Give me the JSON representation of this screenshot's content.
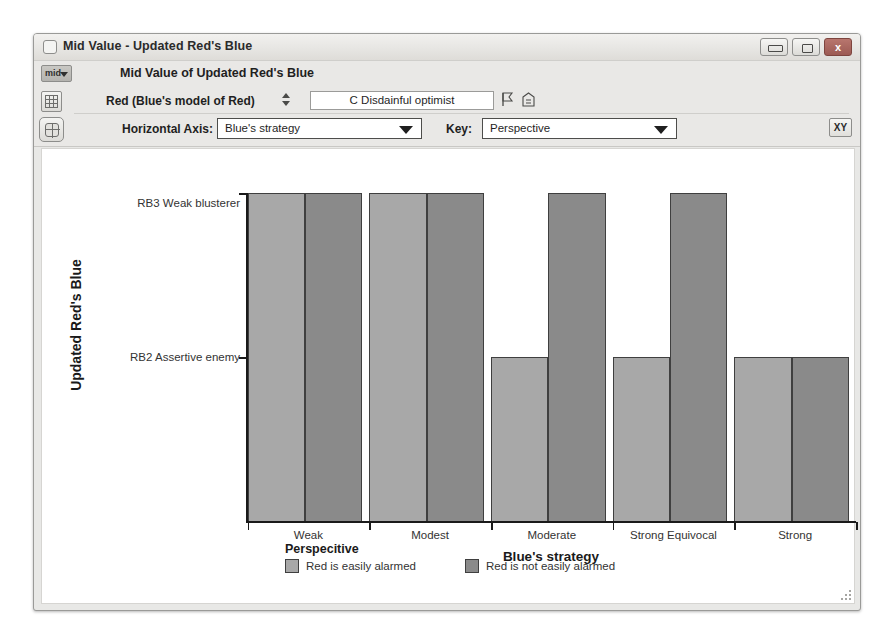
{
  "window": {
    "title": "Mid Value - Updated Red's Blue",
    "title_icon": "window-icon",
    "buttons": {
      "minimize": "minimize-icon",
      "maximize": "maximize-icon",
      "close_label": "x"
    }
  },
  "toolbar": {
    "mid_button_label": "mid",
    "chart_title": "Mid Value of Updated Red's Blue",
    "picker_label": "Red (Blue's model of Red)",
    "picker_value": "C Disdainful optimist",
    "picker_placeholder": "C Disdainful optimist",
    "updown_icon": "up-down-arrow-icon",
    "mini_icon_1": "flag-icon",
    "mini_icon_2": "building-icon",
    "grid_icon": "grid-icon",
    "table_icon": "table-icon",
    "horizontal_axis_label": "Horizontal Axis:",
    "horizontal_axis_value": "Blue's strategy",
    "horizontal_axis_options": [
      "Blue's strategy"
    ],
    "key_label": "Key:",
    "key_value": "Perspective",
    "key_options": [
      "Perspective"
    ],
    "xy_button_label": "XY"
  },
  "chart_data": {
    "type": "bar",
    "title": "Mid Value of Updated Red's Blue",
    "xlabel": "Blue's strategy",
    "ylabel": "Updated Red's Blue",
    "grid": false,
    "legend_position": "bottom",
    "legend_title": "Perspecitive",
    "categories": [
      "Weak",
      "Modest",
      "Moderate",
      "Strong Equivocal",
      "Strong"
    ],
    "ytick_labels": [
      "RB3 Weak blusterer",
      "RB2 Assertive enemy"
    ],
    "ytick_values": [
      3,
      2
    ],
    "ylim": [
      1,
      3
    ],
    "series": [
      {
        "name": "Red is easily alarmed",
        "color": "#a8a8a8",
        "values": [
          3,
          3,
          2,
          2,
          2
        ]
      },
      {
        "name": "Red is not easily alarmed",
        "color": "#8a8a8a",
        "values": [
          3,
          3,
          3,
          3,
          2
        ]
      }
    ]
  },
  "colors": {
    "series_light": "#a8a8a8",
    "series_dark": "#8a8a8a",
    "bar_border": "#3f3f3f",
    "axis": "#1a1a1a",
    "close_button": "#a66159"
  }
}
